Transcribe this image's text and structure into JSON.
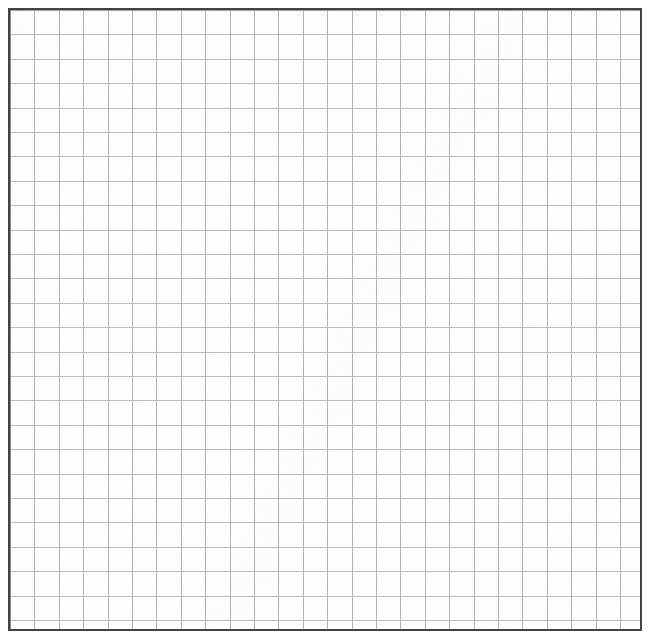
{
  "document": {
    "kind": "grid-paper-sheet",
    "title": "",
    "has_text": false,
    "has_annotations": false,
    "content_text": ""
  },
  "canvas": {
    "width_px": 654,
    "height_px": 639,
    "background_color": "#ffffff",
    "margin_px": 8
  },
  "sheet": {
    "left_px": 8,
    "top_px": 8,
    "width_px": 634,
    "height_px": 623,
    "fill_color": "#fefefe",
    "border_color": "#434343",
    "border_width_px": 2
  },
  "grid": {
    "cell_size_px": 24.4,
    "columns": 26,
    "rows": 25,
    "line_width_px": 1,
    "vertical_line_color": "#b4b4b4",
    "horizontal_line_color": "#bdbdbd",
    "style": "square"
  },
  "chart_data": {
    "type": "table",
    "title": "",
    "subtitle": "",
    "xlabel": "",
    "ylabel": "",
    "grid": true,
    "legend": null,
    "categories": [],
    "values": [],
    "series": [],
    "annotations": [],
    "note": "Blank square-ruled graph paper: 26 columns x 25 rows of empty cells, no plotted data, no tick labels, no legend."
  }
}
